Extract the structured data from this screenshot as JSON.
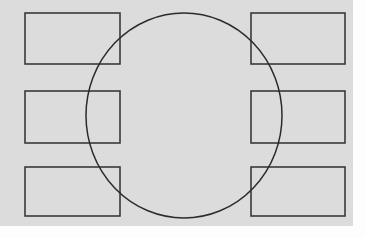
{
  "canvas": {
    "width": 365,
    "height": 238,
    "background_color": "#fdfdfd",
    "plot_background_color": "#dcdcdc",
    "plot_x": 0,
    "plot_y": 0,
    "plot_width": 353,
    "plot_height": 226,
    "stroke_color": "#3a3a3a",
    "circle_stroke_color": "#2b2b2b"
  },
  "diagram": {
    "title": "",
    "type": "venn-grid-overlay",
    "shapes": [
      {
        "name": "rect-top-left",
        "kind": "rectangle",
        "x": 25,
        "y": 13,
        "width": 95,
        "height": 51,
        "label": "",
        "stroke_width": 1.6
      },
      {
        "name": "rect-middle-left",
        "kind": "rectangle",
        "x": 25,
        "y": 91,
        "width": 95,
        "height": 52,
        "label": "",
        "stroke_width": 1.6
      },
      {
        "name": "rect-bottom-left",
        "kind": "rectangle",
        "x": 25,
        "y": 167,
        "width": 95,
        "height": 49,
        "label": "",
        "stroke_width": 1.6
      },
      {
        "name": "rect-top-right",
        "kind": "rectangle",
        "x": 251,
        "y": 13,
        "width": 94,
        "height": 51,
        "label": "",
        "stroke_width": 1.6
      },
      {
        "name": "rect-middle-right",
        "kind": "rectangle",
        "x": 251,
        "y": 91,
        "width": 94,
        "height": 52,
        "label": "",
        "stroke_width": 1.6
      },
      {
        "name": "rect-bottom-right",
        "kind": "rectangle",
        "x": 251,
        "y": 167,
        "width": 94,
        "height": 49,
        "label": "",
        "stroke_width": 1.6
      },
      {
        "name": "overlay-circle",
        "kind": "circle",
        "cx": 184,
        "cy": 115.5,
        "rx": 98,
        "ry": 102.5,
        "label": "",
        "stroke_width": 1.5
      }
    ]
  }
}
